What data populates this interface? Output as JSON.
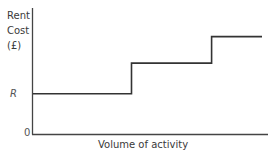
{
  "chart_data": {
    "type": "line",
    "subtype": "step",
    "title": "",
    "ylabel_lines": [
      "Rent",
      "Cost",
      "(£)"
    ],
    "ylabel": "Rent Cost (£)",
    "xlabel": "Volume of activity",
    "y_ticks": [
      "R",
      "0"
    ],
    "x_ticks": [],
    "grid": false,
    "legend": null,
    "series": [
      {
        "name": "Rent cost",
        "points": [
          {
            "x": 0,
            "y": 1
          },
          {
            "x": 0.43,
            "y": 1
          },
          {
            "x": 0.43,
            "y": 1.75
          },
          {
            "x": 0.78,
            "y": 1.75
          },
          {
            "x": 0.78,
            "y": 2.4
          },
          {
            "x": 1.0,
            "y": 2.4
          }
        ],
        "description": "Stepped fixed cost: constant at R, then steps up twice as volume of activity increases"
      }
    ],
    "ylim": [
      0,
      3.1
    ],
    "xlim": [
      0,
      1.0
    ],
    "color": "#333333"
  },
  "labels": {
    "y_line1": "Rent",
    "y_line2": "Cost",
    "y_line3": "(£)",
    "tick_r": "R",
    "tick_0": "0",
    "x_axis": "Volume of activity"
  }
}
